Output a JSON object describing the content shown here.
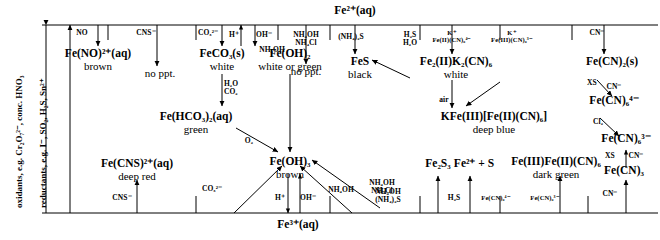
{
  "diagram": {
    "type": "chemistry-reaction-scheme",
    "top_species": "Fe²⁺(aq)",
    "bottom_species": "Fe³⁺(aq)",
    "side_labels": {
      "oxidants": "oxidants, e.g. Cr₂O₇²⁻, conc. HNO₃",
      "reductants": "reductants, e.g. I⁻, SO₂, H₂S, Sn²⁺"
    },
    "products": {
      "fe_no": {
        "formula": "Fe(NO)²⁺(aq)",
        "colour": "brown"
      },
      "no_ppt_1": {
        "formula": "no ppt.",
        "colour": ""
      },
      "feco3": {
        "formula": "FeCO₃(s)",
        "colour": "white"
      },
      "fe_hco3": {
        "formula": "Fe(HCO₃)₂(aq)",
        "colour": "green"
      },
      "fe_oh_2": {
        "formula": "Fe(OH)₂",
        "colour": "white or green"
      },
      "no_ppt_2": {
        "formula": "no ppt.",
        "colour": ""
      },
      "fes": {
        "formula": "FeS",
        "colour": "black"
      },
      "fe2k2cn6": {
        "formula": "Fe₂(II)K₂(CN)₆",
        "colour": "white"
      },
      "fe_cn_2": {
        "formula": "Fe(CN)₂(s)",
        "colour": ""
      },
      "fe_cn_6_4": {
        "formula": "Fe(CN)₆⁴⁻",
        "colour": ""
      },
      "fe_cn_6_3": {
        "formula": "Fe(CN)₆³⁻",
        "colour": ""
      },
      "fe_cn_3": {
        "formula": "Fe(CN)₃",
        "colour": ""
      },
      "kfe_prussian": {
        "formula": "KFe(III)[Fe(II)(CN)₆]",
        "colour": "deep blue"
      },
      "fe_oh_3": {
        "formula": "Fe(OH)₃",
        "colour": "brown"
      },
      "fe_cns": {
        "formula": "Fe(CNS)²⁺(aq)",
        "colour": "deep red"
      },
      "fe2s3": {
        "formula": "Fe₂S₃",
        "colour": ""
      },
      "fe2_plus_s": {
        "formula": "Fe²⁺ + S",
        "colour": ""
      },
      "turnbull": {
        "formula": "Fe(III)Fe(II)(CN)₆",
        "colour": "dark green"
      }
    },
    "reagents": {
      "no": "NO",
      "cns_top": "CNS⁻",
      "co3_top": "CO₃²⁻",
      "h2o_co2": "H₂O\nCO₂",
      "h_plus_top": "H⁺",
      "oh_minus_top": "OH⁻",
      "nh4oh_top": "NH₄OH",
      "nh4oh_nh4cl_top": "NH₄OH\nNH₄Cl",
      "nh4_2s_top": "(NH₄)₂S",
      "h2s_h2o_top": "H₂S\nH₂O",
      "k_fe2_cn6": "K⁺\nFe(II)(CN)₆⁴⁻",
      "k_fe3_cn6": "K⁺\nFe(III)(CN)₆³⁻",
      "cn_top": "CN⁻",
      "xs_cn_1": "XS",
      "cn_minus_1": "CN⁻",
      "cl2": "Cl₂",
      "xs_cn_2": "XS",
      "cn_minus_2": "CN⁻",
      "cn_bottom": "CN⁻",
      "air": "air",
      "o2": "O₂",
      "cns_bottom": "CNS⁻",
      "co3_bottom": "CO₃²⁻",
      "h_plus_bottom": "H⁺",
      "oh_minus_bottom": "OH⁻",
      "nh4oh_bot1": "NH₄OH",
      "nh4oh_nh4cl_bot": "NH₄OH\nNH₄Cl",
      "nh4oh_nh4_2s": "NH₄OH\n(NH₄)₂S",
      "h2s_bottom": "H₂S",
      "fe_cn6_4_bot": "Fe(CN)₆⁴⁻",
      "fe_cn6_3_bot": "Fe(CN)₆³⁻"
    },
    "colors": {
      "ink": "#000000",
      "paper": "#ffffff"
    }
  }
}
